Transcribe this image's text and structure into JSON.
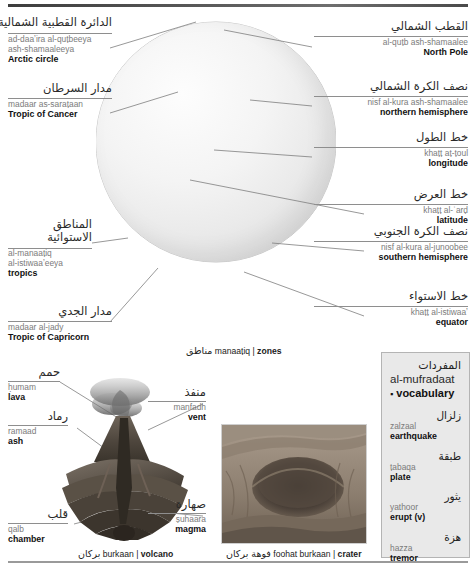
{
  "page": {
    "section_caption_globe": {
      "ar": "مناطق",
      "tr": "manaaṭiq",
      "sep": "|",
      "en": "zones"
    },
    "section_caption_volcano": {
      "ar": "بركان",
      "tr": "burkaan",
      "sep": "|",
      "en": "volcano"
    },
    "section_caption_crater": {
      "ar": "فوهة بركان",
      "tr": "foohat burkaan",
      "sep": "|",
      "en": "crater"
    }
  },
  "globe_labels": [
    {
      "id": "arctic-circle",
      "ar": "الدائرة القطبية الشمالية",
      "tr1": "ad-daaʼira al-quṭbeeya",
      "tr2": "ash-shamaaleeya",
      "en": "Arctic circle"
    },
    {
      "id": "tropic-of-cancer",
      "ar": "مدار السرطان",
      "tr1": "madaar as-saraṭaan",
      "tr2": "",
      "en": "Tropic of Cancer"
    },
    {
      "id": "tropics",
      "ar1": "المناطق",
      "ar2": "الاستوائية",
      "tr1": "al-manaaṭiq",
      "tr2": "al-istiwaaʼeeya",
      "en": "tropics"
    },
    {
      "id": "tropic-of-capricorn",
      "ar": "مدار الجدي",
      "tr1": "madaar al-jady",
      "tr2": "",
      "en": "Tropic of Capricorn"
    },
    {
      "id": "north-pole",
      "ar": "القطب الشمالي",
      "tr1": "al-quṭb ash-shamaalee",
      "tr2": "",
      "en": "North Pole"
    },
    {
      "id": "northern-hemisphere",
      "ar": "نصف الكرة الشمالي",
      "tr1": "nisf al-kura ash-shamaalee",
      "tr2": "",
      "en": "northern hemisphere"
    },
    {
      "id": "longitude",
      "ar": "خط الطول",
      "tr1": "khaṭṭ aṭ-ṭoul",
      "tr2": "",
      "en": "longitude"
    },
    {
      "id": "latitude",
      "ar": "خط العرض",
      "tr1": "khaṭṭ al-ʿarḍ",
      "tr2": "",
      "en": "latitude"
    },
    {
      "id": "southern-hemisphere",
      "ar": "نصف الكرة الجنوبي",
      "tr1": "nisf al-kura al-junoobee",
      "tr2": "",
      "en": "southern hemisphere"
    },
    {
      "id": "equator",
      "ar": "خط الاستواء",
      "tr1": "khaṭṭ al-istiwaaʼ",
      "tr2": "",
      "en": "equator"
    }
  ],
  "volcano_labels": [
    {
      "id": "lava",
      "ar": "حمم",
      "tr": "ḥumam",
      "en": "lava"
    },
    {
      "id": "ash",
      "ar": "رماد",
      "tr": "ramaad",
      "en": "ash"
    },
    {
      "id": "vent",
      "ar": "منفذ",
      "tr": "manfadh",
      "en": "vent"
    },
    {
      "id": "chamber",
      "ar": "قلب",
      "tr": "qalb",
      "en": "chamber"
    },
    {
      "id": "magma",
      "ar": "صهارة",
      "tr": "ṣuhaara",
      "en": "magma"
    }
  ],
  "vocabulary": {
    "title_ar": "المفردات",
    "title_tr": "al-mufradaat",
    "bullet": "▪",
    "title_en": "vocabulary",
    "terms": [
      {
        "ar": "زلزال",
        "tr": "zalzaal",
        "en": "earthquake"
      },
      {
        "ar": "طبقة",
        "tr": "ṭabaqa",
        "en": "plate"
      },
      {
        "ar": "يثور",
        "tr": "yathoor",
        "en": "erupt (v)"
      },
      {
        "ar": "هزة",
        "tr": "hazza",
        "en": "tremor"
      }
    ]
  },
  "colors": {
    "vocab_bg": "#e9e9e9",
    "vocab_border": "#b4b4b4",
    "rule": "#8e8e8e",
    "transliteration": "#7b7b7b",
    "english": "#111111"
  }
}
